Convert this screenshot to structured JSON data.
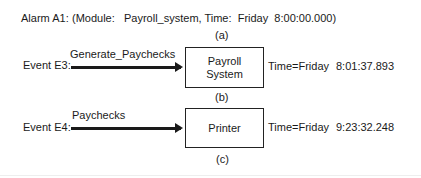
{
  "alarm": {
    "label": "Alarm A1:",
    "text": "(Module:   Payroll_system, Time:  Friday  8:00:00.000)",
    "caption": "(a)"
  },
  "events": [
    {
      "label": "Event E3:",
      "arrow_label": "Generate_Paychecks",
      "box_lines": [
        "Payroll",
        "System"
      ],
      "time_label": "Time=Friday",
      "time_value": "8:01:37.893",
      "caption": "(b)"
    },
    {
      "label": "Event E4:",
      "arrow_label": "Paychecks",
      "box_lines": [
        "Printer"
      ],
      "time_label": "Time=Friday",
      "time_value": "9:23:32.248",
      "caption": "(c)"
    }
  ]
}
